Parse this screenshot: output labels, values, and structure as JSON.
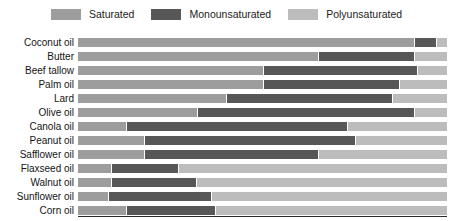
{
  "legend": {
    "items": [
      {
        "label": "Saturated",
        "color": "#9d9d9d",
        "icon": "legend-swatch-icon"
      },
      {
        "label": "Monounsaturated",
        "color": "#575757",
        "icon": "legend-swatch-icon"
      },
      {
        "label": "Polyunsaturated",
        "color": "#bcbcbc",
        "icon": "legend-swatch-icon"
      }
    ]
  },
  "chart_data": {
    "type": "bar",
    "orientation": "horizontal",
    "stacked": true,
    "normalized": true,
    "title": "",
    "xlabel": "",
    "ylabel": "",
    "xlim": [
      0,
      100
    ],
    "grid": false,
    "legend_position": "top-center",
    "categories": [
      "Coconut oil",
      "Butter",
      "Beef tallow",
      "Palm oil",
      "Lard",
      "Olive oil",
      "Canola oil",
      "Peanut oil",
      "Safflower oil",
      "Flaxseed oil",
      "Walnut oil",
      "Sunflower oil",
      "Corn oil"
    ],
    "series": [
      {
        "name": "Saturated",
        "color": "#9d9d9d",
        "values": [
          91,
          65,
          50,
          50,
          40,
          40,
          13,
          18,
          18,
          9,
          9,
          8,
          13
        ]
      },
      {
        "name": "Monounsaturated",
        "color": "#575757",
        "values": [
          6,
          26,
          42,
          37,
          45,
          73,
          60,
          57,
          47,
          18,
          23,
          28,
          24
        ]
      },
      {
        "name": "Polyunsaturated",
        "color": "#bcbcbc",
        "values": [
          3,
          9,
          8,
          13,
          15,
          11,
          27,
          25,
          35,
          73,
          68,
          64,
          63
        ]
      }
    ]
  }
}
